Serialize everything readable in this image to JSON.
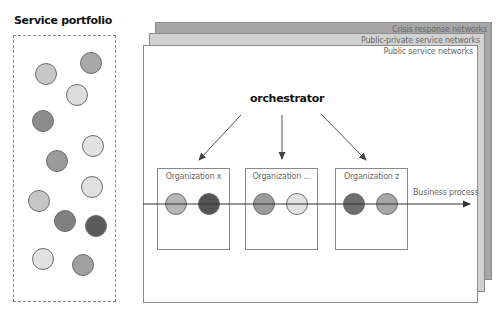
{
  "portfolio": {
    "title": "Service portfolio",
    "services": [
      {
        "x": 35,
        "y": 63,
        "color": "#c8c8c8"
      },
      {
        "x": 80,
        "y": 52,
        "color": "#a8a8a8"
      },
      {
        "x": 66,
        "y": 84,
        "color": "#dcdcdc"
      },
      {
        "x": 32,
        "y": 110,
        "color": "#8c8c8c"
      },
      {
        "x": 82,
        "y": 135,
        "color": "#e2e2e2"
      },
      {
        "x": 46,
        "y": 150,
        "color": "#9a9a9a"
      },
      {
        "x": 81,
        "y": 176,
        "color": "#e0e0e0"
      },
      {
        "x": 28,
        "y": 190,
        "color": "#c6c6c6"
      },
      {
        "x": 54,
        "y": 210,
        "color": "#808080"
      },
      {
        "x": 85,
        "y": 215,
        "color": "#5a5a5a"
      },
      {
        "x": 32,
        "y": 248,
        "color": "#e2e2e2"
      },
      {
        "x": 72,
        "y": 254,
        "color": "#a0a0a0"
      }
    ]
  },
  "layers": {
    "back": "Crisis response networks",
    "middle": "Public-private service networks",
    "front": "Public service networks"
  },
  "orchestrator": {
    "label": "orchestrator"
  },
  "organizations": [
    {
      "label": "Organization x",
      "left": 157,
      "services": [
        {
          "color": "#b4b4b4"
        },
        {
          "color": "#545454"
        }
      ]
    },
    {
      "label": "Organization ...",
      "left": 245,
      "services": [
        {
          "color": "#9a9a9a"
        },
        {
          "color": "#e2e2e2"
        }
      ]
    },
    {
      "label": "Organization z",
      "left": 335,
      "services": [
        {
          "color": "#6e6e6e"
        },
        {
          "color": "#a6a6a6"
        }
      ]
    }
  ],
  "business_process": {
    "label": "Business process"
  }
}
